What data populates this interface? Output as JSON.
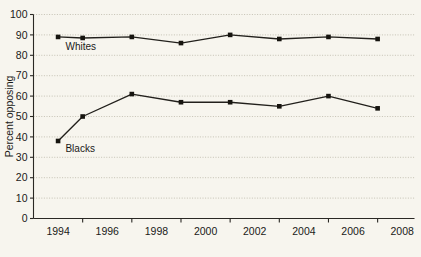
{
  "chart_data": {
    "type": "line",
    "title": "",
    "xlabel": "",
    "ylabel": "Percent opposing",
    "xlim": [
      1993,
      2008.5
    ],
    "ylim": [
      0,
      100
    ],
    "grid": true,
    "legend_position": "inline-labels",
    "x_tick_labels": [
      "1994",
      "1996",
      "1998",
      "2000",
      "2002",
      "2004",
      "2006",
      "2008"
    ],
    "x_tick_values": [
      1994,
      1996,
      1998,
      2000,
      2002,
      2004,
      2006,
      2008
    ],
    "x_minor_tick_values": [
      1995,
      1997,
      1999,
      2001,
      2003,
      2005,
      2007
    ],
    "y_tick_labels": [
      "0",
      "10",
      "20",
      "30",
      "40",
      "50",
      "60",
      "70",
      "80",
      "90",
      "100"
    ],
    "y_tick_values": [
      0,
      10,
      20,
      30,
      40,
      50,
      60,
      70,
      80,
      90,
      100
    ],
    "x": [
      1994,
      1995,
      1997,
      1999,
      2001,
      2003,
      2005,
      2007
    ],
    "series": [
      {
        "name": "Whites",
        "label": "Whites",
        "color": "#22201c",
        "values": [
          89,
          88.5,
          89,
          86,
          90,
          88,
          89,
          88
        ],
        "label_x": 1994.3,
        "label_y": 82.5
      },
      {
        "name": "Blacks",
        "label": "Blacks",
        "color": "#22201c",
        "values": [
          38,
          50,
          61,
          57,
          57,
          55,
          60,
          54
        ],
        "label_x": 1994.3,
        "label_y": 32.5
      }
    ]
  },
  "colors": {
    "background": "#f7f5ee",
    "axis": "#2a2824",
    "grid": "#b9b5a6",
    "line": "#22201c",
    "text": "#1a1a18"
  }
}
